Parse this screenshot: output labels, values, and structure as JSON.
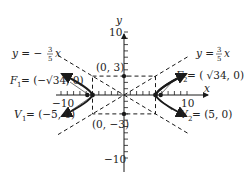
{
  "diagram": {
    "type": "hyperbola",
    "equation_center": [
      0,
      0
    ],
    "a": 5,
    "b": 3,
    "axes": {
      "x_label": "x",
      "y_label": "y",
      "x_tick_label_pos": "10",
      "x_tick_label_neg": "−10",
      "y_tick_label_pos": "10",
      "y_tick_label_neg": "−10"
    },
    "asymptotes": [
      {
        "label_prefix": "y = ",
        "num": "3",
        "den": "5",
        "suffix": "x",
        "sign": ""
      },
      {
        "label_prefix": "y = −",
        "num": "3",
        "den": "5",
        "suffix": "x",
        "sign": "−"
      }
    ],
    "points": {
      "co_vertex_top": "(0, 3)",
      "co_vertex_bottom": "(0, −3)",
      "focus1": {
        "name": "F",
        "sub": "1",
        "value": " = (−√34, 0)"
      },
      "focus2": {
        "name": "F",
        "sub": "2",
        "value": " = ( √34, 0)"
      },
      "vertex1": {
        "name": "V",
        "sub": "1",
        "value": " = (−5, 0)"
      },
      "vertex2": {
        "name": "V",
        "sub": "2",
        "value": " = (5, 0)"
      }
    },
    "colors": {
      "ink": "#1a1a1a"
    }
  }
}
